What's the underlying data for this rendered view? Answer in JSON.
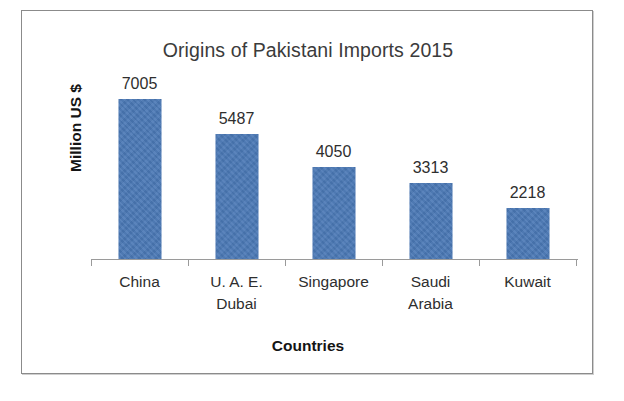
{
  "chart_data": {
    "type": "bar",
    "title": "Origins of Pakistani Imports 2015",
    "xlabel": "Countries",
    "ylabel": "Million US $",
    "categories": [
      "China",
      "U. A. E. Dubai",
      "Singapore",
      "Saudi Arabia",
      "Kuwait"
    ],
    "category_lines": [
      [
        "China"
      ],
      [
        "U. A. E.",
        "Dubai"
      ],
      [
        "Singapore"
      ],
      [
        "Saudi",
        "Arabia"
      ],
      [
        "Kuwait"
      ]
    ],
    "values": [
      7005,
      5487,
      4050,
      3313,
      2218
    ],
    "value_labels": [
      "7005",
      "5487",
      "4050",
      "3313",
      "2218"
    ],
    "ylim": [
      0,
      7800
    ],
    "grid": false,
    "legend": false,
    "axis_ticks_visible": false,
    "bar_color": "#4a78b5",
    "axis_color": "#9a9a9a",
    "title_color": "#3b3b3b",
    "label_color": "#2e2e2e"
  }
}
